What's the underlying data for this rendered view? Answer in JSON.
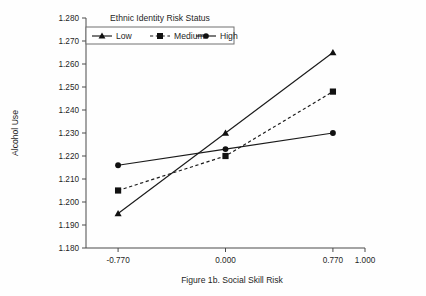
{
  "figure": {
    "background_color": "#fefefe",
    "ink_color": "#1a1a1a",
    "axis_color": "#4a4a4a"
  },
  "legend": {
    "title": "Ethnic Identity Risk Status",
    "position": "top-center-inside",
    "entries": [
      {
        "label": "Low",
        "marker": "triangle-marker",
        "line_style": "solid"
      },
      {
        "label": "Medium",
        "marker": "square-marker",
        "line_style": "dashed"
      },
      {
        "label": "High",
        "marker": "circle-marker",
        "line_style": "solid"
      }
    ]
  },
  "axes": {
    "y_title": "Alcohol Use",
    "x_title": "Figure 1b. Social Skill Risk",
    "y_ticks": [
      "1.180",
      "1.190",
      "1.200",
      "1.210",
      "1.220",
      "1.230",
      "1.240",
      "1.250",
      "1.260",
      "1.270",
      "1.280"
    ],
    "x_ticks": [
      "-0.770",
      "0.000",
      "0.770",
      "1.000"
    ]
  },
  "chart_data": {
    "type": "line",
    "title": "",
    "subtitle": "",
    "xlabel": "Figure 1b. Social Skill Risk",
    "ylabel": "Alcohol Use",
    "x": [
      -0.77,
      0.0,
      0.77
    ],
    "x_tick_values": [
      -0.77,
      0.0,
      0.77,
      1.0
    ],
    "xlim": [
      -1.0,
      1.0
    ],
    "ylim": [
      1.18,
      1.28
    ],
    "y_tick_values": [
      1.18,
      1.19,
      1.2,
      1.21,
      1.22,
      1.23,
      1.24,
      1.25,
      1.26,
      1.27,
      1.28
    ],
    "grid": false,
    "legend_position": "top-center",
    "legend_title": "Ethnic Identity Risk Status",
    "series": [
      {
        "name": "Low",
        "marker": "triangle",
        "line_style": "solid",
        "values": [
          1.195,
          1.23,
          1.265
        ]
      },
      {
        "name": "Medium",
        "marker": "square",
        "line_style": "dashed",
        "values": [
          1.205,
          1.22,
          1.248
        ]
      },
      {
        "name": "High",
        "marker": "circle",
        "line_style": "solid",
        "values": [
          1.216,
          1.223,
          1.23
        ]
      }
    ]
  }
}
